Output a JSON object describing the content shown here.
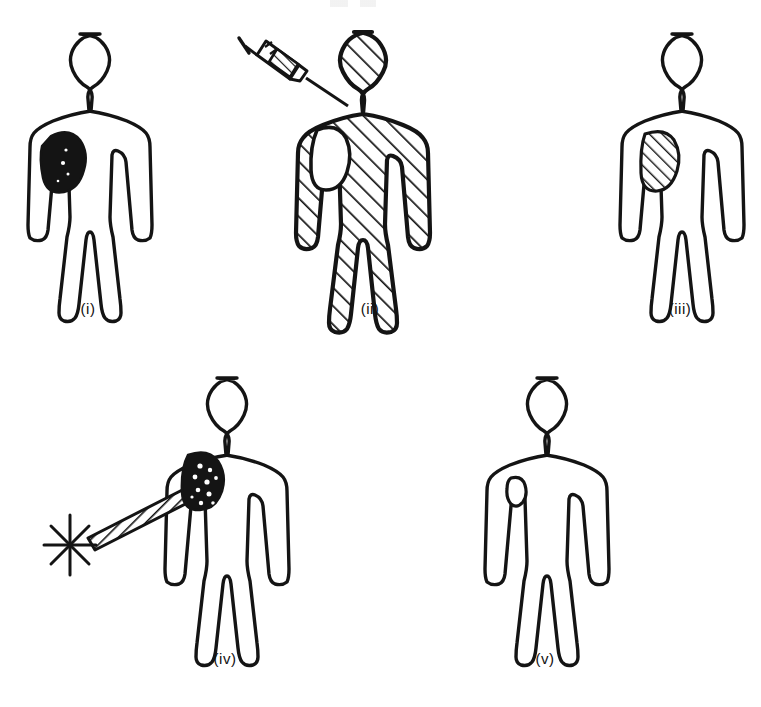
{
  "figure": {
    "background_color": "#ffffff",
    "ink_color": "#111111",
    "panel_count": 5
  },
  "panels": [
    {
      "id": "panel-i",
      "caption": "(i)",
      "body_fill": "none",
      "marker": {
        "name": "tumour-solid",
        "style": "solid-black-blob",
        "location": "right chest",
        "fill_color": "#141414"
      },
      "accessories": []
    },
    {
      "id": "panel-ii",
      "caption": "(ii)",
      "body_fill": "diagonal-hatch",
      "marker": {
        "name": "tumour-unfilled",
        "style": "outline-only-oval",
        "location": "right chest",
        "fill_color": "#ffffff"
      },
      "accessories": [
        "syringe"
      ]
    },
    {
      "id": "panel-iii",
      "caption": "(iii)",
      "body_fill": "none",
      "marker": {
        "name": "tumour-hatched",
        "style": "diagonal-hatched-oval",
        "location": "right chest",
        "fill_color": "#ffffff"
      },
      "accessories": []
    },
    {
      "id": "panel-iv",
      "caption": "(iv)",
      "body_fill": "none",
      "marker": {
        "name": "tumour-stippled",
        "style": "dark-speckled-blob",
        "location": "right chest",
        "fill_color": "#141414"
      },
      "accessories": [
        "radiation-burst",
        "collimated-beam"
      ]
    },
    {
      "id": "panel-v",
      "caption": "(v)",
      "body_fill": "none",
      "marker": {
        "name": "tumour-small-outline",
        "style": "small-empty-oval",
        "location": "right chest",
        "fill_color": "#ffffff"
      },
      "accessories": []
    }
  ],
  "icons": {
    "syringe": "syringe-icon",
    "burst": "radiation-burst-icon",
    "beam": "collimated-beam-icon"
  }
}
